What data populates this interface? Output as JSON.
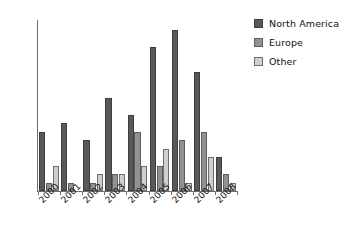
{
  "chart_data": {
    "type": "bar",
    "title": "",
    "subtitle": "",
    "xlabel": "",
    "ylabel": "",
    "grid": false,
    "legend_position": "right",
    "categories": [
      "2000",
      "2001",
      "2002",
      "2003",
      "2004",
      "2005",
      "2006",
      "2007",
      "2008"
    ],
    "ylim": [
      0,
      20
    ],
    "yticks": [
      0,
      5,
      10,
      15,
      20
    ],
    "ytick_labels": [
      "0",
      "5",
      "10",
      "15",
      "20"
    ],
    "series": [
      {
        "name": "North America",
        "color": "#595959",
        "values": [
          7,
          8,
          6,
          11,
          9,
          17,
          19,
          14,
          4
        ]
      },
      {
        "name": "Europe",
        "color": "#919191",
        "values": [
          1,
          1,
          1,
          2,
          7,
          3,
          6,
          7,
          2
        ]
      },
      {
        "name": "Other",
        "color": "#cfcfcf",
        "values": [
          3,
          0,
          2,
          2,
          3,
          5,
          1,
          4,
          1
        ]
      }
    ]
  }
}
